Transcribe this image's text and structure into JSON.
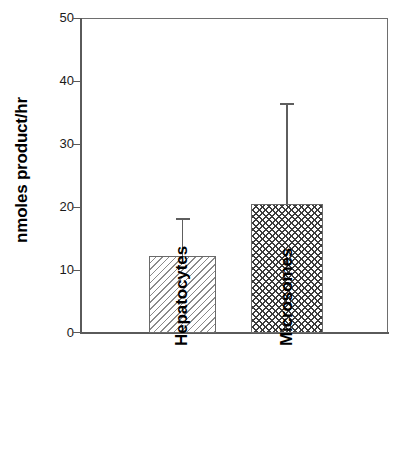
{
  "chart_data": {
    "type": "bar",
    "title": "",
    "subtitle": "",
    "xlabel": "",
    "ylabel": "nmoles product/hr",
    "categories": [
      "Hepatocytes",
      "Microsomes"
    ],
    "values": [
      12.2,
      20.5
    ],
    "errors": [
      6.0,
      16.0
    ],
    "error_tops": [
      18.2,
      36.5
    ],
    "series": [
      {
        "name": "nmoles product/hr",
        "values": [
          12.2,
          20.5
        ],
        "errors": [
          6.0,
          16.0
        ]
      }
    ],
    "ylim": [
      0,
      50
    ],
    "yticks": [
      0,
      10,
      20,
      30,
      40,
      50
    ],
    "ytick_labels": [
      "0",
      "10",
      "20",
      "30",
      "40",
      "50"
    ],
    "xticks": [],
    "grid": false,
    "legend": false,
    "legend_position": "none",
    "bar_patterns": [
      "diagonal-hatch",
      "cross-hatch"
    ],
    "errorbar_style": "upper-only-with-cap",
    "annotations": []
  },
  "axes": {
    "y_title": "nmoles product/hr",
    "tick_labels": [
      {
        "text": "50",
        "value": 50
      },
      {
        "text": "40",
        "value": 40
      },
      {
        "text": "30",
        "value": 30
      },
      {
        "text": "20",
        "value": 20
      },
      {
        "text": "10",
        "value": 10
      },
      {
        "text": "0",
        "value": 0
      }
    ]
  },
  "bars": [
    {
      "category": "Hepatocytes",
      "value": 12.2,
      "error": 6.0,
      "pattern": "diagonal-hatch"
    },
    {
      "category": "Microsomes",
      "value": 20.5,
      "error": 16.0,
      "pattern": "cross-hatch"
    }
  ],
  "colors": {
    "background": "#ffffff",
    "axis": "#5a5a5a",
    "frame": "#6e6e6e",
    "bar_outline": "#6a6a6a",
    "hatch_light": "#8a8a8a",
    "hatch_dark": "#3c3c3c",
    "text": "#000000"
  }
}
